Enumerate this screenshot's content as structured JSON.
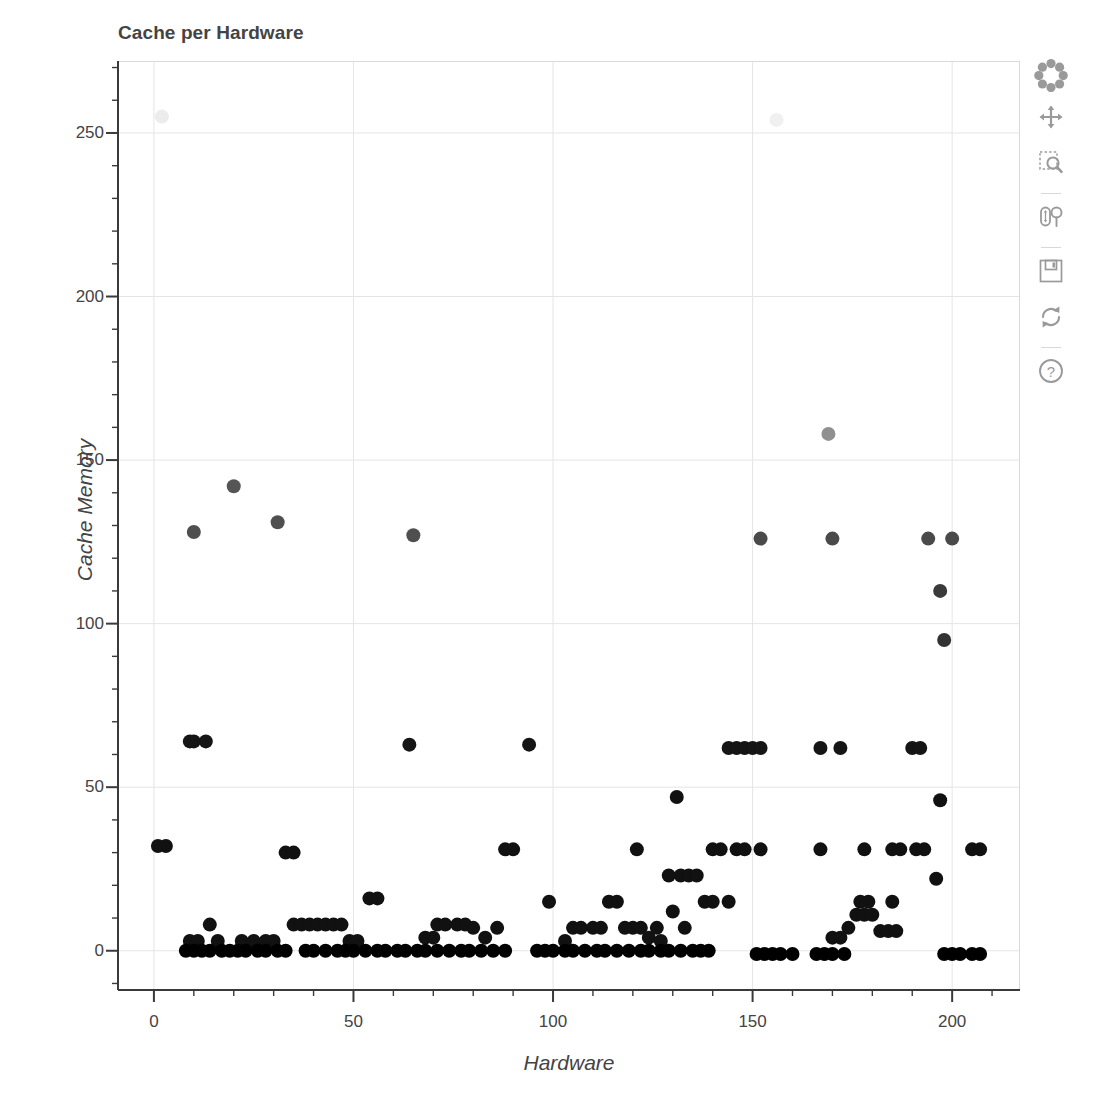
{
  "plot": {
    "title": "Cache per Hardware",
    "xlabel": "Hardware",
    "ylabel": "Cache Memory"
  },
  "toolbar": {
    "items": [
      {
        "name": "bokeh-logo-icon",
        "label": "Bokeh"
      },
      {
        "name": "pan-tool",
        "label": "Pan"
      },
      {
        "name": "box-zoom-tool",
        "label": "Box Zoom"
      },
      {
        "name": "wheel-zoom-tool",
        "label": "Wheel Zoom"
      },
      {
        "name": "save-tool",
        "label": "Save"
      },
      {
        "name": "reset-tool",
        "label": "Reset"
      },
      {
        "name": "help-tool",
        "label": "Help"
      }
    ]
  },
  "chart_data": {
    "type": "scatter",
    "title": "Cache per Hardware",
    "xlabel": "Hardware",
    "ylabel": "Cache Memory",
    "xlim": [
      -9,
      217
    ],
    "ylim": [
      -12,
      272
    ],
    "xticks": [
      0,
      50,
      100,
      150,
      200
    ],
    "yticks": [
      0,
      50,
      100,
      150,
      200,
      250
    ],
    "x_minor_step": 10,
    "y_minor_step": 10,
    "grid": true,
    "legend": "none",
    "marker": "circle",
    "marker_size": 14,
    "colors": {
      "low": "#111111",
      "mid": "#4a4a4a",
      "high": "#8c8c8c",
      "very_high": "#e8e8e8"
    },
    "points": [
      {
        "x": 2,
        "y": 255,
        "c": "#ececec"
      },
      {
        "x": 156,
        "y": 254,
        "c": "#f0f0f0"
      },
      {
        "x": 169,
        "y": 158,
        "c": "#909090"
      },
      {
        "x": 20,
        "y": 142,
        "c": "#555555"
      },
      {
        "x": 31,
        "y": 131,
        "c": "#4f4f4f"
      },
      {
        "x": 10,
        "y": 128,
        "c": "#4f4f4f"
      },
      {
        "x": 65,
        "y": 127,
        "c": "#4f4f4f"
      },
      {
        "x": 152,
        "y": 126,
        "c": "#4a4a4a"
      },
      {
        "x": 170,
        "y": 126,
        "c": "#4a4a4a"
      },
      {
        "x": 194,
        "y": 126,
        "c": "#4a4a4a"
      },
      {
        "x": 200,
        "y": 126,
        "c": "#4a4a4a"
      },
      {
        "x": 197,
        "y": 110,
        "c": "#3a3a3a"
      },
      {
        "x": 198,
        "y": 95,
        "c": "#333333"
      },
      {
        "x": 9,
        "y": 64,
        "c": "#151515"
      },
      {
        "x": 10,
        "y": 64,
        "c": "#151515"
      },
      {
        "x": 13,
        "y": 64,
        "c": "#151515"
      },
      {
        "x": 64,
        "y": 63,
        "c": "#151515"
      },
      {
        "x": 94,
        "y": 63,
        "c": "#151515"
      },
      {
        "x": 144,
        "y": 62,
        "c": "#151515"
      },
      {
        "x": 146,
        "y": 62,
        "c": "#151515"
      },
      {
        "x": 148,
        "y": 62,
        "c": "#151515"
      },
      {
        "x": 150,
        "y": 62,
        "c": "#151515"
      },
      {
        "x": 152,
        "y": 62,
        "c": "#151515"
      },
      {
        "x": 167,
        "y": 62,
        "c": "#151515"
      },
      {
        "x": 172,
        "y": 62,
        "c": "#151515"
      },
      {
        "x": 190,
        "y": 62,
        "c": "#151515"
      },
      {
        "x": 192,
        "y": 62,
        "c": "#151515"
      },
      {
        "x": 131,
        "y": 47,
        "c": "#111111"
      },
      {
        "x": 197,
        "y": 46,
        "c": "#111111"
      },
      {
        "x": 1,
        "y": 32,
        "c": "#111111"
      },
      {
        "x": 3,
        "y": 32,
        "c": "#111111"
      },
      {
        "x": 33,
        "y": 30,
        "c": "#111111"
      },
      {
        "x": 35,
        "y": 30,
        "c": "#111111"
      },
      {
        "x": 88,
        "y": 31,
        "c": "#111111"
      },
      {
        "x": 90,
        "y": 31,
        "c": "#111111"
      },
      {
        "x": 121,
        "y": 31,
        "c": "#111111"
      },
      {
        "x": 140,
        "y": 31,
        "c": "#111111"
      },
      {
        "x": 142,
        "y": 31,
        "c": "#111111"
      },
      {
        "x": 146,
        "y": 31,
        "c": "#111111"
      },
      {
        "x": 148,
        "y": 31,
        "c": "#111111"
      },
      {
        "x": 152,
        "y": 31,
        "c": "#111111"
      },
      {
        "x": 167,
        "y": 31,
        "c": "#111111"
      },
      {
        "x": 178,
        "y": 31,
        "c": "#111111"
      },
      {
        "x": 185,
        "y": 31,
        "c": "#111111"
      },
      {
        "x": 187,
        "y": 31,
        "c": "#111111"
      },
      {
        "x": 191,
        "y": 31,
        "c": "#111111"
      },
      {
        "x": 193,
        "y": 31,
        "c": "#111111"
      },
      {
        "x": 205,
        "y": 31,
        "c": "#111111"
      },
      {
        "x": 207,
        "y": 31,
        "c": "#111111"
      },
      {
        "x": 196,
        "y": 22,
        "c": "#111111"
      },
      {
        "x": 129,
        "y": 23,
        "c": "#111111"
      },
      {
        "x": 132,
        "y": 23,
        "c": "#111111"
      },
      {
        "x": 134,
        "y": 23,
        "c": "#111111"
      },
      {
        "x": 136,
        "y": 23,
        "c": "#111111"
      },
      {
        "x": 54,
        "y": 16,
        "c": "#111111"
      },
      {
        "x": 56,
        "y": 16,
        "c": "#111111"
      },
      {
        "x": 99,
        "y": 15,
        "c": "#111111"
      },
      {
        "x": 114,
        "y": 15,
        "c": "#111111"
      },
      {
        "x": 116,
        "y": 15,
        "c": "#111111"
      },
      {
        "x": 138,
        "y": 15,
        "c": "#111111"
      },
      {
        "x": 140,
        "y": 15,
        "c": "#111111"
      },
      {
        "x": 144,
        "y": 15,
        "c": "#111111"
      },
      {
        "x": 177,
        "y": 15,
        "c": "#111111"
      },
      {
        "x": 179,
        "y": 15,
        "c": "#111111"
      },
      {
        "x": 185,
        "y": 15,
        "c": "#111111"
      },
      {
        "x": 130,
        "y": 12,
        "c": "#111111"
      },
      {
        "x": 176,
        "y": 11,
        "c": "#111111"
      },
      {
        "x": 178,
        "y": 11,
        "c": "#111111"
      },
      {
        "x": 180,
        "y": 11,
        "c": "#111111"
      },
      {
        "x": 14,
        "y": 8,
        "c": "#111111"
      },
      {
        "x": 35,
        "y": 8,
        "c": "#111111"
      },
      {
        "x": 37,
        "y": 8,
        "c": "#111111"
      },
      {
        "x": 39,
        "y": 8,
        "c": "#111111"
      },
      {
        "x": 41,
        "y": 8,
        "c": "#111111"
      },
      {
        "x": 43,
        "y": 8,
        "c": "#111111"
      },
      {
        "x": 45,
        "y": 8,
        "c": "#111111"
      },
      {
        "x": 47,
        "y": 8,
        "c": "#111111"
      },
      {
        "x": 71,
        "y": 8,
        "c": "#111111"
      },
      {
        "x": 73,
        "y": 8,
        "c": "#111111"
      },
      {
        "x": 76,
        "y": 8,
        "c": "#111111"
      },
      {
        "x": 78,
        "y": 8,
        "c": "#111111"
      },
      {
        "x": 80,
        "y": 7,
        "c": "#111111"
      },
      {
        "x": 86,
        "y": 7,
        "c": "#111111"
      },
      {
        "x": 105,
        "y": 7,
        "c": "#111111"
      },
      {
        "x": 107,
        "y": 7,
        "c": "#111111"
      },
      {
        "x": 110,
        "y": 7,
        "c": "#111111"
      },
      {
        "x": 112,
        "y": 7,
        "c": "#111111"
      },
      {
        "x": 118,
        "y": 7,
        "c": "#111111"
      },
      {
        "x": 120,
        "y": 7,
        "c": "#111111"
      },
      {
        "x": 122,
        "y": 7,
        "c": "#111111"
      },
      {
        "x": 126,
        "y": 7,
        "c": "#111111"
      },
      {
        "x": 133,
        "y": 7,
        "c": "#111111"
      },
      {
        "x": 174,
        "y": 7,
        "c": "#111111"
      },
      {
        "x": 182,
        "y": 6,
        "c": "#111111"
      },
      {
        "x": 184,
        "y": 6,
        "c": "#111111"
      },
      {
        "x": 186,
        "y": 6,
        "c": "#111111"
      },
      {
        "x": 9,
        "y": 3,
        "c": "#111111"
      },
      {
        "x": 11,
        "y": 3,
        "c": "#111111"
      },
      {
        "x": 16,
        "y": 3,
        "c": "#111111"
      },
      {
        "x": 22,
        "y": 3,
        "c": "#111111"
      },
      {
        "x": 25,
        "y": 3,
        "c": "#111111"
      },
      {
        "x": 28,
        "y": 3,
        "c": "#111111"
      },
      {
        "x": 30,
        "y": 3,
        "c": "#111111"
      },
      {
        "x": 49,
        "y": 3,
        "c": "#111111"
      },
      {
        "x": 51,
        "y": 3,
        "c": "#111111"
      },
      {
        "x": 68,
        "y": 4,
        "c": "#111111"
      },
      {
        "x": 70,
        "y": 4,
        "c": "#111111"
      },
      {
        "x": 83,
        "y": 4,
        "c": "#111111"
      },
      {
        "x": 103,
        "y": 3,
        "c": "#111111"
      },
      {
        "x": 124,
        "y": 4,
        "c": "#111111"
      },
      {
        "x": 127,
        "y": 3,
        "c": "#111111"
      },
      {
        "x": 170,
        "y": 4,
        "c": "#111111"
      },
      {
        "x": 172,
        "y": 4,
        "c": "#111111"
      },
      {
        "x": 8,
        "y": 0,
        "c": "#000000"
      },
      {
        "x": 10,
        "y": 0,
        "c": "#000000"
      },
      {
        "x": 12,
        "y": 0,
        "c": "#000000"
      },
      {
        "x": 14,
        "y": 0,
        "c": "#000000"
      },
      {
        "x": 17,
        "y": 0,
        "c": "#000000"
      },
      {
        "x": 19,
        "y": 0,
        "c": "#000000"
      },
      {
        "x": 21,
        "y": 0,
        "c": "#000000"
      },
      {
        "x": 23,
        "y": 0,
        "c": "#000000"
      },
      {
        "x": 26,
        "y": 0,
        "c": "#000000"
      },
      {
        "x": 28,
        "y": 0,
        "c": "#000000"
      },
      {
        "x": 31,
        "y": 0,
        "c": "#000000"
      },
      {
        "x": 33,
        "y": 0,
        "c": "#000000"
      },
      {
        "x": 38,
        "y": 0,
        "c": "#000000"
      },
      {
        "x": 40,
        "y": 0,
        "c": "#000000"
      },
      {
        "x": 43,
        "y": 0,
        "c": "#000000"
      },
      {
        "x": 46,
        "y": 0,
        "c": "#000000"
      },
      {
        "x": 48,
        "y": 0,
        "c": "#000000"
      },
      {
        "x": 50,
        "y": 0,
        "c": "#000000"
      },
      {
        "x": 53,
        "y": 0,
        "c": "#000000"
      },
      {
        "x": 56,
        "y": 0,
        "c": "#000000"
      },
      {
        "x": 58,
        "y": 0,
        "c": "#000000"
      },
      {
        "x": 61,
        "y": 0,
        "c": "#000000"
      },
      {
        "x": 63,
        "y": 0,
        "c": "#000000"
      },
      {
        "x": 66,
        "y": 0,
        "c": "#000000"
      },
      {
        "x": 68,
        "y": 0,
        "c": "#000000"
      },
      {
        "x": 71,
        "y": 0,
        "c": "#000000"
      },
      {
        "x": 74,
        "y": 0,
        "c": "#000000"
      },
      {
        "x": 77,
        "y": 0,
        "c": "#000000"
      },
      {
        "x": 79,
        "y": 0,
        "c": "#000000"
      },
      {
        "x": 82,
        "y": 0,
        "c": "#000000"
      },
      {
        "x": 85,
        "y": 0,
        "c": "#000000"
      },
      {
        "x": 88,
        "y": 0,
        "c": "#000000"
      },
      {
        "x": 96,
        "y": 0,
        "c": "#000000"
      },
      {
        "x": 98,
        "y": 0,
        "c": "#000000"
      },
      {
        "x": 100,
        "y": 0,
        "c": "#000000"
      },
      {
        "x": 103,
        "y": 0,
        "c": "#000000"
      },
      {
        "x": 105,
        "y": 0,
        "c": "#000000"
      },
      {
        "x": 108,
        "y": 0,
        "c": "#000000"
      },
      {
        "x": 111,
        "y": 0,
        "c": "#000000"
      },
      {
        "x": 113,
        "y": 0,
        "c": "#000000"
      },
      {
        "x": 116,
        "y": 0,
        "c": "#000000"
      },
      {
        "x": 119,
        "y": 0,
        "c": "#000000"
      },
      {
        "x": 122,
        "y": 0,
        "c": "#000000"
      },
      {
        "x": 124,
        "y": 0,
        "c": "#000000"
      },
      {
        "x": 127,
        "y": 0,
        "c": "#000000"
      },
      {
        "x": 129,
        "y": 0,
        "c": "#000000"
      },
      {
        "x": 132,
        "y": 0,
        "c": "#000000"
      },
      {
        "x": 135,
        "y": 0,
        "c": "#000000"
      },
      {
        "x": 137,
        "y": 0,
        "c": "#000000"
      },
      {
        "x": 139,
        "y": 0,
        "c": "#000000"
      },
      {
        "x": 151,
        "y": -1,
        "c": "#000000"
      },
      {
        "x": 153,
        "y": -1,
        "c": "#000000"
      },
      {
        "x": 155,
        "y": -1,
        "c": "#000000"
      },
      {
        "x": 157,
        "y": -1,
        "c": "#000000"
      },
      {
        "x": 160,
        "y": -1,
        "c": "#000000"
      },
      {
        "x": 166,
        "y": -1,
        "c": "#000000"
      },
      {
        "x": 168,
        "y": -1,
        "c": "#000000"
      },
      {
        "x": 170,
        "y": -1,
        "c": "#000000"
      },
      {
        "x": 173,
        "y": -1,
        "c": "#000000"
      },
      {
        "x": 198,
        "y": -1,
        "c": "#000000"
      },
      {
        "x": 200,
        "y": -1,
        "c": "#000000"
      },
      {
        "x": 202,
        "y": -1,
        "c": "#000000"
      },
      {
        "x": 205,
        "y": -1,
        "c": "#000000"
      },
      {
        "x": 207,
        "y": -1,
        "c": "#000000"
      }
    ]
  }
}
